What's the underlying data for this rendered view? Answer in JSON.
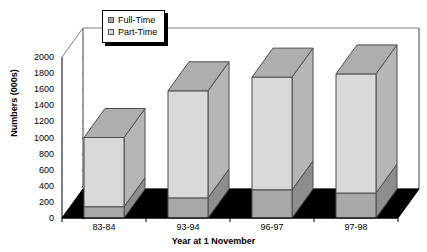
{
  "chart_data": {
    "type": "bar",
    "subtype": "stacked-3d-column",
    "title": "",
    "xlabel": "Year at 1 November",
    "ylabel": "Numbers (000s)",
    "categories": [
      "83-84",
      "93-94",
      "96-97",
      "97-98"
    ],
    "ylim": [
      0,
      2000
    ],
    "ytick_step": 200,
    "ytick_labels": [
      "0",
      "200",
      "400",
      "600",
      "800",
      "1000",
      "1200",
      "1400",
      "1600",
      "1800",
      "2000"
    ],
    "grid": false,
    "legend_position": "top-center",
    "series": [
      {
        "name": "Full-Time",
        "color": "#a8a8a8",
        "values": [
          140,
          250,
          350,
          310
        ]
      },
      {
        "name": "Part-Time",
        "color": "#d9d9d9",
        "values": [
          860,
          1330,
          1400,
          1480
        ]
      }
    ],
    "totals": [
      1000,
      1580,
      1750,
      1790
    ],
    "annotations": []
  },
  "legend": {
    "items": [
      {
        "label": "Full-Time",
        "swatch": "full-time-swatch"
      },
      {
        "label": "Part-Time",
        "swatch": "part-time-swatch"
      }
    ]
  },
  "axes": {
    "y_title": "Numbers (000s)",
    "x_title": "Year at 1 November"
  },
  "colors": {
    "full_time": "#a8a8a8",
    "part_time": "#d9d9d9",
    "floor": "#000000",
    "wall": "#ffffff",
    "outline": "#4d4d4d",
    "axis": "#000000"
  }
}
